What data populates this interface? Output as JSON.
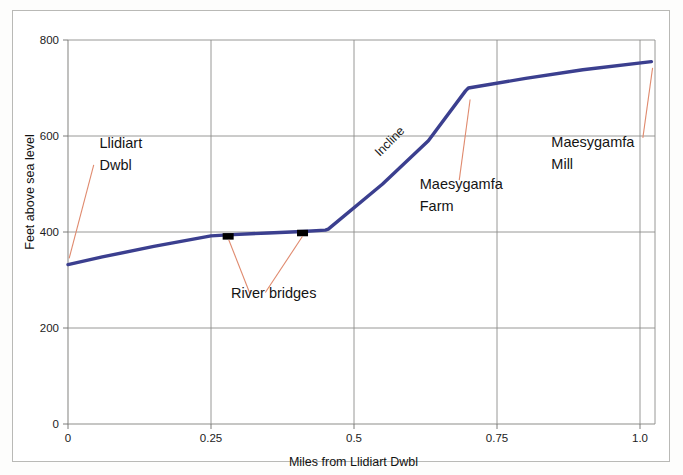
{
  "chart_data": {
    "type": "line",
    "title": "",
    "xlabel": "Miles from Llidiart Dwbl",
    "ylabel": "Feet above sea level",
    "xlim": [
      0,
      1.04
    ],
    "ylim": [
      0,
      800
    ],
    "grid": true,
    "legend": "none",
    "xticks": [
      "0",
      "0.25",
      "0.5",
      "0.75",
      "1.0"
    ],
    "xtick_values": [
      0,
      0.25,
      0.5,
      0.75,
      1.0
    ],
    "yticks": [
      "0",
      "200",
      "400",
      "600",
      "800"
    ],
    "ytick_values": [
      0,
      200,
      400,
      600,
      800
    ],
    "series": [
      {
        "name": "Track profile",
        "color": "#3b3f8f",
        "x": [
          0.0,
          0.06,
          0.15,
          0.25,
          0.28,
          0.35,
          0.41,
          0.45,
          0.455,
          0.55,
          0.63,
          0.695,
          0.7,
          0.8,
          0.9,
          1.02
        ],
        "values": [
          332,
          348,
          370,
          392,
          394,
          398,
          401,
          404,
          406,
          500,
          590,
          694,
          700,
          720,
          738,
          755
        ]
      }
    ],
    "markers": [
      {
        "label": "River bridge 1",
        "x": 0.28,
        "y": 394,
        "shape": "square",
        "color": "#000000"
      },
      {
        "label": "River bridge 2",
        "x": 0.41,
        "y": 401,
        "shape": "square",
        "color": "#000000"
      }
    ],
    "annotations": [
      {
        "id": "llidiart-dwbl",
        "lines": [
          "Llidiart",
          "Dwbl"
        ],
        "text_x": 0.055,
        "text_y": 575,
        "leader_from_x": 0.045,
        "leader_from_y": 540,
        "leader_to_x": 0.002,
        "leader_to_y": 345,
        "leader_color": "#e08a6e"
      },
      {
        "id": "river-bridges",
        "lines": [
          "River bridges"
        ],
        "text_x": 0.285,
        "text_y": 262,
        "leader_color": "#e08a6e",
        "leaders": [
          {
            "from_x": 0.318,
            "from_y": 272,
            "to_x": 0.281,
            "to_y": 384
          },
          {
            "from_x": 0.345,
            "from_y": 274,
            "to_x": 0.41,
            "to_y": 391
          }
        ]
      },
      {
        "id": "incline",
        "lines": [
          "Incline"
        ],
        "text_x": 0.545,
        "text_y": 556,
        "rotation": -45
      },
      {
        "id": "maesygamfa-farm",
        "lines": [
          "Maesygamfa",
          "Farm"
        ],
        "text_x": 0.615,
        "text_y": 490,
        "leader_from_x": 0.684,
        "leader_from_y": 508,
        "leader_to_x": 0.703,
        "leader_to_y": 676,
        "leader_color": "#e08a6e"
      },
      {
        "id": "maesygamfa-mill",
        "lines": [
          "Maesygamfa",
          "Mill"
        ],
        "text_x": 0.845,
        "text_y": 578,
        "leader_from_x": 1.005,
        "leader_from_y": 596,
        "leader_to_x": 1.022,
        "leader_to_y": 742,
        "leader_color": "#e08a6e"
      }
    ],
    "colors": {
      "line": "#3b3f8f",
      "grid": "#8d8d8a",
      "axis": "#6e6e6b",
      "leader": "#e08a6e",
      "text": "#141414",
      "background": "#ffffff",
      "frame": "#b9b9b6"
    }
  }
}
